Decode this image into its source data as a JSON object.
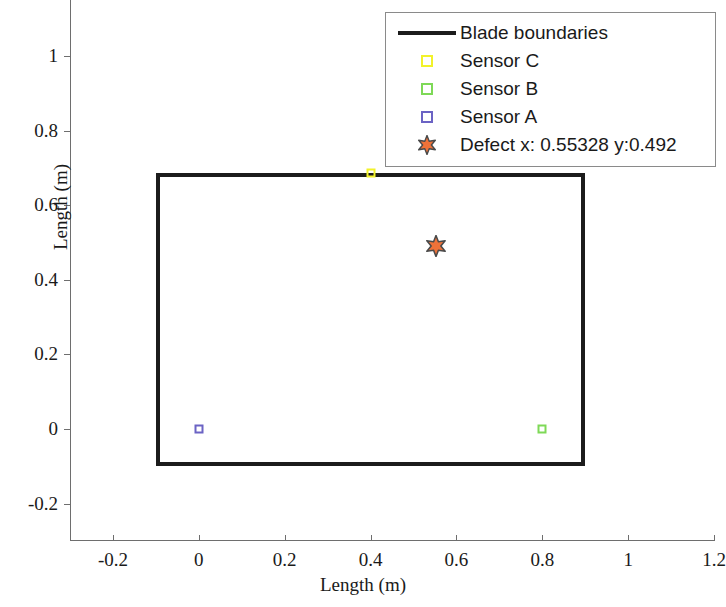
{
  "chart_data": {
    "type": "scatter",
    "title": "",
    "xlabel": "Length (m)",
    "ylabel": "Length (m)",
    "xlim": [
      -0.3,
      1.2
    ],
    "ylim": [
      -0.3,
      1.15
    ],
    "xticks": [
      "-0.2",
      "0",
      "0.2",
      "0.4",
      "0.6",
      "0.8",
      "1",
      "1.2"
    ],
    "xtick_values": [
      -0.2,
      0,
      0.2,
      0.4,
      0.6,
      0.8,
      1,
      1.2
    ],
    "yticks": [
      "-0.2",
      "0",
      "0.2",
      "0.4",
      "0.6",
      "0.8",
      "1"
    ],
    "ytick_values": [
      -0.2,
      0,
      0.2,
      0.4,
      0.6,
      0.8,
      1
    ],
    "grid": false,
    "legend_position": "top-right",
    "blade_boundary": {
      "name": "Blade boundaries",
      "x_min": -0.1,
      "x_max": 0.9,
      "y_min": -0.1,
      "y_max": 0.685,
      "color": "#1c1c1c"
    },
    "series": [
      {
        "name": "Sensor C",
        "marker": "square",
        "color": "#f2f22a",
        "points": [
          {
            "x": 0.4,
            "y": 0.685
          }
        ]
      },
      {
        "name": "Sensor B",
        "marker": "square",
        "color": "#7ed957",
        "points": [
          {
            "x": 0.8,
            "y": 0.0
          }
        ]
      },
      {
        "name": "Sensor A",
        "marker": "square",
        "color": "#6b63c4",
        "points": [
          {
            "x": 0.0,
            "y": 0.0
          }
        ]
      },
      {
        "name": "Defect  x: 0.55328  y:0.492",
        "marker": "hexagram",
        "color": "#ef7239",
        "edge_color": "#4a4a4a",
        "points": [
          {
            "x": 0.55328,
            "y": 0.492
          }
        ]
      }
    ]
  },
  "legend": {
    "items": [
      {
        "label": "Blade boundaries",
        "key": "line",
        "color": "#1c1c1c"
      },
      {
        "label": "Sensor C",
        "key": "square",
        "color": "#f2f22a"
      },
      {
        "label": "Sensor B",
        "key": "square",
        "color": "#7ed957"
      },
      {
        "label": "Sensor A",
        "key": "square",
        "color": "#6b63c4"
      },
      {
        "label": "Defect  x: 0.55328  y:0.492",
        "key": "hexagram",
        "color": "#ef7239"
      }
    ]
  }
}
